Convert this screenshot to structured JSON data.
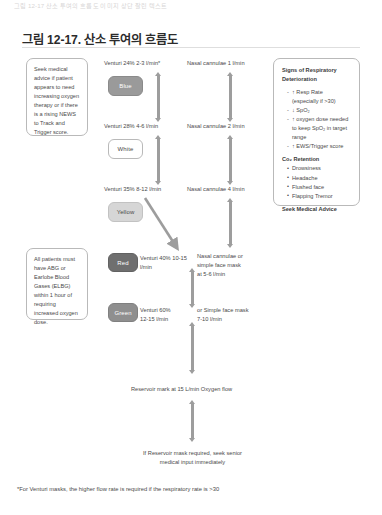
{
  "page": {
    "ghost_header": "그림 12-17  산소 투여의 흐름도 이미지 상단 잘린 텍스트",
    "title": "그림 12-17. 산소 투여의 흐름도",
    "footnote": "*For Venturi masks, the higher flow rate is required if the respiratory rate is >30"
  },
  "left_panels": [
    {
      "id": "seek-advice",
      "text": "Seek medical advice if patient appears to need increasing oxygen therapy or if there is a rising NEWS to Track and Trigger score."
    },
    {
      "id": "abg",
      "text": "All patients must have ABG or Earlobe Blood Gases (ELBG) within 1 hour of requiring increased oxygen dose."
    }
  ],
  "venturi": {
    "chips": [
      {
        "label": "Blue",
        "fill": "#9a9a9a",
        "text_color": "#ffffff",
        "border": "#8a8a8a"
      },
      {
        "label": "White",
        "fill": "#ffffff",
        "text_color": "#4a4a4a",
        "border": "#b9b9b9"
      },
      {
        "label": "Yellow",
        "fill": "#d6d6d6",
        "text_color": "#4a4a4a",
        "border": "#c2c2c2"
      },
      {
        "label": "Red",
        "fill": "#6f6f6f",
        "text_color": "#ffffff",
        "border": "#626262"
      },
      {
        "label": "Green",
        "fill": "#8f8f8f",
        "text_color": "#ffffff",
        "border": "#808080"
      }
    ],
    "captions": [
      "Venturi 24% 2-3 l/min*",
      "Venturi 28% 4-6 l/min",
      "Venturi 35% 8-12 l/min",
      "Venturi 40% 10-15\nl/min",
      "Venturi 60%\n12-15 l/min"
    ]
  },
  "delivery": {
    "captions": [
      "Nasal cannulae 1 l/min",
      "Nasal cannulae 2 l/min",
      "Nasal cannulae 4 l/min",
      "Nasal cannulae or\nsimple face mask\nat 5-6 l/min",
      "or Simple face mask\n7-10 l/min"
    ]
  },
  "bottom": {
    "reservoir": "Reservoir mark at 15 L/min Oxygen flow",
    "escalate": "If Reservoir mask required, seek senior\nmedical input immediately"
  },
  "signs_panel": {
    "heading": "Signs of Respiratory\nDeterioration",
    "items": [
      "↑ Resp Rate\n(especially if >30)",
      "↓ SpO₂",
      "↑ oxygen dose needed\nto keep SpO₂ in target\nrange",
      "↑ EWS/Trigger score"
    ],
    "co2_heading": "Co₂ Retention",
    "co2_items": [
      "Drowsiness",
      "Headache",
      "Flushed face",
      "Flapping Tremor"
    ],
    "advice": "Seek Medical Advice"
  }
}
